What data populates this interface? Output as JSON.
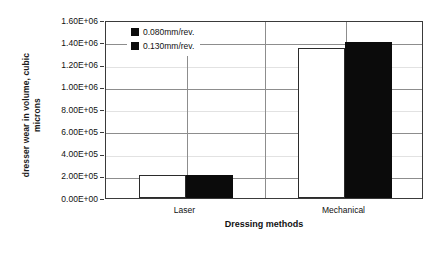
{
  "chart_data": {
    "type": "bar",
    "title": "",
    "xlabel": "Dressing methods",
    "ylabel": "dresser wear in volume, cubic microns",
    "ylabel_line1": "dresser wear in volume, cubic",
    "ylabel_line2": "microns",
    "categories": [
      "Laser",
      "Mechanical"
    ],
    "series": [
      {
        "name": "0.080mm/rev.",
        "values": [
          210000,
          1350000
        ],
        "color": "#ffffff",
        "edge_color": "#2b2b2b"
      },
      {
        "name": "0.130mm/rev.",
        "values": [
          210000,
          1400000
        ],
        "color": "#0b0b0b",
        "edge_color": "#0b0b0b"
      }
    ],
    "ylim": [
      0,
      1600000
    ],
    "ytick_step": 200000,
    "ytick_labels": [
      "1.60E+06",
      "1.40E+06",
      "1.20E+06",
      "1.00E+06",
      "8.00E+05",
      "6.00E+05",
      "4.00E+05",
      "2.00E+05",
      "0.00E+00"
    ],
    "ytick_values": [
      1600000,
      1400000,
      1200000,
      1000000,
      800000,
      600000,
      400000,
      200000,
      0
    ],
    "grid": true,
    "grid_axis": "y",
    "legend_position": "upper left inside plot",
    "background_color": "#ffffff",
    "axis_color": "#3a3a3a"
  }
}
